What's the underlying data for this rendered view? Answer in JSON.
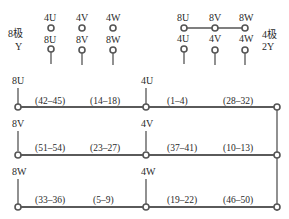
{
  "top_left_group": {
    "title_line1": "8极",
    "title_line2": "Y",
    "top_row": [
      "4U",
      "4V",
      "4W"
    ],
    "bottom_row": [
      "8U",
      "8V",
      "8W"
    ]
  },
  "top_right_group": {
    "title_line1": "4极",
    "title_line2": "2Y",
    "top_row": [
      "8U",
      "8V",
      "8W"
    ],
    "bottom_row": [
      "4U",
      "4V",
      "4W"
    ]
  },
  "windings": [
    {
      "start_label": "8U",
      "mid_label": "4U",
      "segments": [
        "(42–45)",
        "(14–18)",
        "(1–4)",
        "(28–32)"
      ]
    },
    {
      "start_label": "8V",
      "mid_label": "4V",
      "segments": [
        "(51–54)",
        "(23–27)",
        "(37–41)",
        "(10–13)"
      ]
    },
    {
      "start_label": "8W",
      "mid_label": "4W",
      "segments": [
        "(33–36)",
        "(5–9)",
        "(19–22)",
        "(46–50)"
      ]
    }
  ],
  "colors": {
    "line": "#555555",
    "text": "#2a2a2a",
    "background": "#ffffff"
  }
}
